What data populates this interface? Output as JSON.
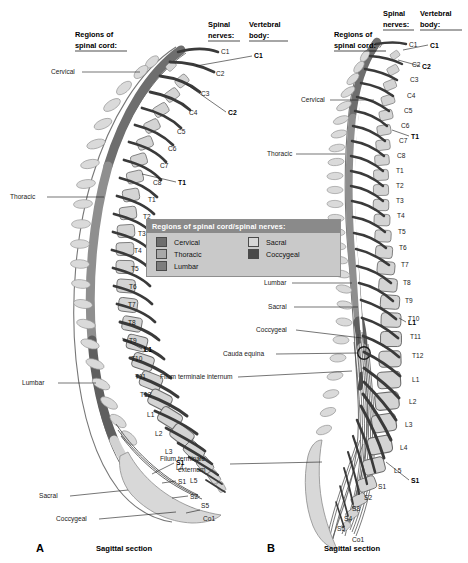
{
  "figure": {
    "type": "anatomical-diagram",
    "background_color": "#ffffff"
  },
  "legend": {
    "title": "Regions of spinal cord/spinal nerves:",
    "title_bg": "#8a8a8a",
    "box_bg": "#c9c9c9",
    "items": [
      {
        "label": "Cervical",
        "color": "#6e6e6e"
      },
      {
        "label": "Sacral",
        "color": "#d6d6d6"
      },
      {
        "label": "Thoracic",
        "color": "#a8a8a8"
      },
      {
        "label": "Coccygeal",
        "color": "#4a4a4a"
      },
      {
        "label": "Lumbar",
        "color": "#7d7d7d"
      }
    ]
  },
  "panels": [
    {
      "id": "A",
      "letter": "A",
      "caption": "Sagittal section",
      "headings": {
        "regions": [
          "Regions of",
          "spinal cord:"
        ],
        "nerves": [
          "Spinal",
          "nerves:"
        ],
        "vertebral": [
          "Vertebral",
          "body:"
        ]
      },
      "region_labels": [
        "Cervical",
        "Thoracic",
        "Lumbar",
        "Sacral",
        "Coccygeal"
      ],
      "nerve_labels": [
        "C1",
        "C2",
        "C3",
        "C4",
        "C5",
        "C6",
        "C7",
        "C8",
        "T1",
        "T2",
        "T3",
        "T4",
        "T5",
        "T6",
        "T7",
        "T8",
        "T9",
        "T10",
        "T11",
        "T12",
        "L1",
        "L2",
        "L3",
        "L4",
        "L5",
        "S1",
        "S2",
        "S5",
        "Co1"
      ],
      "vertebral_labels": [
        "C1",
        "C2",
        "T1",
        "L1",
        "S1"
      ]
    },
    {
      "id": "B",
      "letter": "B",
      "caption": "Sagittal section",
      "headings": {
        "regions": [
          "Regions of",
          "spinal cord:"
        ],
        "nerves": [
          "Spinal",
          "nerves:"
        ],
        "vertebral": [
          "Vertebral",
          "body:"
        ]
      },
      "region_labels": [
        "Cervical",
        "Thoracic",
        "Lumbar",
        "Sacral",
        "Coccygeal"
      ],
      "structure_labels": [
        "Cauda equina",
        "Filum terminale internum",
        "Filum terminale externum"
      ],
      "nerve_labels": [
        "C1",
        "C2",
        "C3",
        "C4",
        "C5",
        "C6",
        "C7",
        "C8",
        "T1",
        "T2",
        "T3",
        "T4",
        "T5",
        "T6",
        "T7",
        "T8",
        "T9",
        "T10",
        "T11",
        "T12",
        "L1",
        "L2",
        "L3",
        "L4",
        "L5",
        "S1",
        "S2",
        "S3",
        "S4",
        "S5",
        "Co1"
      ],
      "vertebral_labels": [
        "C1",
        "C2",
        "T1",
        "L1",
        "S1"
      ]
    }
  ],
  "text": {
    "regions_l1": "Regions of",
    "regions_l2": "spinal cord:",
    "nerves_l1": "Spinal",
    "nerves_l2": "nerves:",
    "vert_l1": "Vertebral",
    "vert_l2": "body:",
    "cervical": "Cervical",
    "thoracic": "Thoracic",
    "lumbar": "Lumbar",
    "sacral": "Sacral",
    "coccygeal": "Coccygeal",
    "cauda_equina": "Cauda equina",
    "filum_int": "Filum terminale internum",
    "filum_ext_l1": "Filum terminale",
    "filum_ext_l2": "externum",
    "sagittal": "Sagittal section",
    "letter_a": "A",
    "letter_b": "B",
    "C1": "C1",
    "C2": "C2",
    "C3": "C3",
    "C4": "C4",
    "C5": "C5",
    "C6": "C6",
    "C7": "C7",
    "C8": "C8",
    "T1": "T1",
    "T2": "T2",
    "T3": "T3",
    "T4": "T4",
    "T5": "T5",
    "T6": "T6",
    "T7": "T7",
    "T8": "T8",
    "T9": "T9",
    "T10": "T10",
    "T11": "T11",
    "T12": "T12",
    "L1": "L1",
    "L2": "L2",
    "L3": "L3",
    "L4": "L4",
    "L5": "L5",
    "S1": "S1",
    "S2": "S2",
    "S3": "S3",
    "S4": "S4",
    "S5": "S5",
    "Co1": "Co1"
  },
  "colors": {
    "cord_cervical": "#6e6e6e",
    "cord_thoracic": "#8f8f8f",
    "cord_lumbar": "#5f5f5f",
    "cord_sacral": "#d2d2d2",
    "cord_coccygeal": "#4a4a4a",
    "vertebra_fill": "#d4d4d4",
    "vertebra_stroke": "#6b6b6b",
    "nerve": "#3a3a3a",
    "spinous": "#d8d8d8",
    "canal": "#ffffff",
    "text": "#1a1a1a"
  }
}
